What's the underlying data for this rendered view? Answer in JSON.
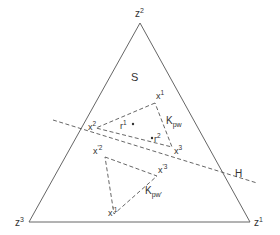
{
  "diagram": {
    "type": "simplex",
    "region_label": "S",
    "hyperplane_label": "H",
    "colors": {
      "lines": "#666666",
      "text": "#333333",
      "background": "#ffffff"
    },
    "vertices": {
      "z1": {
        "base": "z",
        "sup": "1"
      },
      "z2": {
        "base": "z",
        "sup": "2"
      },
      "z3": {
        "base": "z",
        "sup": "3"
      }
    },
    "triangle_kpw": {
      "label_base": "K",
      "label_sub": "pw",
      "x1": {
        "base": "x",
        "sup": "1"
      },
      "x2": {
        "base": "x",
        "sup": "2"
      },
      "x3": {
        "base": "x",
        "sup": "3"
      }
    },
    "triangle_kpw_prime": {
      "label_base": "K",
      "label_sub": "pw'",
      "x1": {
        "base": "x",
        "sup": "'1"
      },
      "x2": {
        "base": "x",
        "sup": "'2"
      },
      "x3": {
        "base": "x",
        "sup": "'3"
      }
    },
    "points": {
      "r1": {
        "base": "r",
        "sup": "1"
      },
      "r2": {
        "base": "r",
        "sup": "2"
      }
    }
  }
}
